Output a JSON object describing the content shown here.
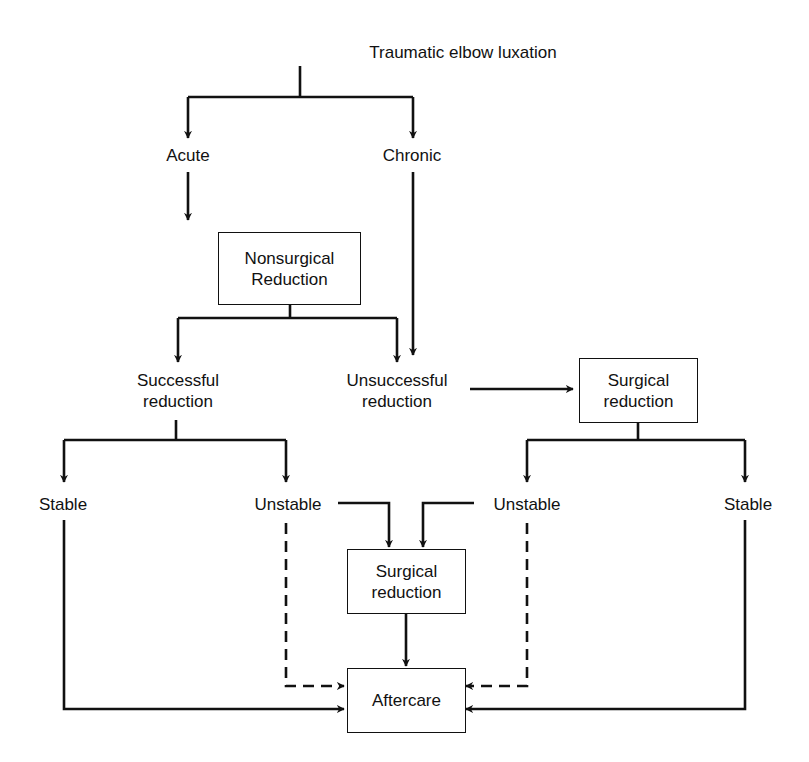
{
  "diagram": {
    "title": "Traumatic elbow luxation",
    "nodes": {
      "root": "Traumatic elbow luxation",
      "acute": "Acute",
      "chronic": "Chronic",
      "nonsurgical": {
        "line1": "Nonsurgical",
        "line2": "Reduction"
      },
      "successful": {
        "line1": "Successful",
        "line2": "reduction"
      },
      "unsuccessful": {
        "line1": "Unsuccessful",
        "line2": "reduction"
      },
      "surgical_right": {
        "line1": "Surgical",
        "line2": "reduction"
      },
      "stable_left": "Stable",
      "unstable_left": "Unstable",
      "unstable_right": "Unstable",
      "stable_right": "Stable",
      "surgical_center": {
        "line1": "Surgical",
        "line2": "reduction"
      },
      "aftercare": "Aftercare"
    },
    "edges": [
      {
        "from": "Traumatic elbow luxation",
        "to": "Acute",
        "style": "solid"
      },
      {
        "from": "Traumatic elbow luxation",
        "to": "Chronic",
        "style": "solid"
      },
      {
        "from": "Acute",
        "to": "Nonsurgical Reduction",
        "style": "solid"
      },
      {
        "from": "Chronic",
        "to": "Surgical reduction",
        "style": "solid"
      },
      {
        "from": "Nonsurgical Reduction",
        "to": "Successful reduction",
        "style": "solid"
      },
      {
        "from": "Nonsurgical Reduction",
        "to": "Unsuccessful reduction",
        "style": "solid"
      },
      {
        "from": "Unsuccessful reduction",
        "to": "Surgical reduction",
        "style": "solid"
      },
      {
        "from": "Successful reduction",
        "to": "Stable",
        "style": "solid"
      },
      {
        "from": "Successful reduction",
        "to": "Unstable",
        "style": "solid"
      },
      {
        "from": "Surgical reduction",
        "to": "Unstable",
        "style": "solid"
      },
      {
        "from": "Surgical reduction",
        "to": "Stable",
        "style": "solid"
      },
      {
        "from": "Unstable (left)",
        "to": "Surgical reduction (center)",
        "style": "solid"
      },
      {
        "from": "Unstable (right)",
        "to": "Surgical reduction (center)",
        "style": "solid"
      },
      {
        "from": "Surgical reduction (center)",
        "to": "Aftercare",
        "style": "solid"
      },
      {
        "from": "Unstable (left)",
        "to": "Aftercare",
        "style": "dashed"
      },
      {
        "from": "Unstable (right)",
        "to": "Aftercare",
        "style": "dashed"
      },
      {
        "from": "Stable (left)",
        "to": "Aftercare",
        "style": "solid"
      },
      {
        "from": "Stable (right)",
        "to": "Aftercare",
        "style": "solid"
      }
    ],
    "colors": {
      "line": "#111111",
      "background": "#ffffff"
    }
  }
}
